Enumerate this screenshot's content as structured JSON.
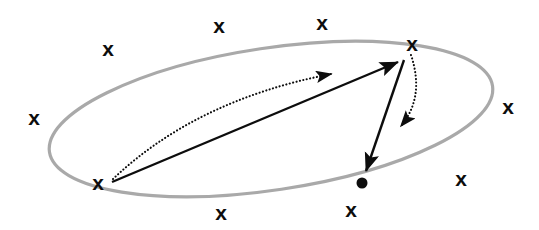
{
  "figure": {
    "name": "manifold-trajectory-diagram",
    "background_color": "#ffffff",
    "width": 539,
    "height": 230
  },
  "region": {
    "name": "ellipse-boundary",
    "shape": "ellipse",
    "label": "",
    "stroke_color": "#a9a9a9",
    "stroke_width": 3.2,
    "fill": "none",
    "center_x": 271,
    "center_y": 119,
    "radius_x": 224,
    "radius_y": 71,
    "rotation_deg": -8.5
  },
  "markers": {
    "glyph": "x",
    "color": "#0d0d0d",
    "font_size": 21,
    "items": [
      {
        "name": "x-marker-top-left-outer",
        "x": 108,
        "y": 48
      },
      {
        "name": "x-marker-top-mid-left",
        "x": 219,
        "y": 25
      },
      {
        "name": "x-marker-top-mid-right",
        "x": 322,
        "y": 22
      },
      {
        "name": "x-marker-top-right",
        "x": 412,
        "y": 43
      },
      {
        "name": "x-marker-right",
        "x": 508,
        "y": 106
      },
      {
        "name": "x-marker-bottom-right",
        "x": 461,
        "y": 178
      },
      {
        "name": "x-marker-bottom-mid-right",
        "x": 351,
        "y": 209
      },
      {
        "name": "x-marker-bottom-mid-left",
        "x": 221,
        "y": 212
      },
      {
        "name": "x-marker-left",
        "x": 34,
        "y": 117
      },
      {
        "name": "x-marker-source-point",
        "x": 98,
        "y": 182
      }
    ]
  },
  "point": {
    "name": "filled-dot-endpoint",
    "x": 362,
    "y": 183,
    "radius": 5.5,
    "color": "#0d0d0d"
  },
  "arrows": {
    "solid": [
      {
        "name": "solid-arrow-main-ascending",
        "style": "solid",
        "color": "#0d0d0d",
        "stroke_width": 2.4,
        "from_x": 112,
        "from_y": 182,
        "to_x": 398,
        "to_y": 62
      },
      {
        "name": "solid-arrow-descending-to-dot",
        "style": "solid",
        "color": "#0d0d0d",
        "stroke_width": 2.4,
        "from_x": 404,
        "from_y": 60,
        "to_x": 366,
        "to_y": 171
      }
    ],
    "dotted": [
      {
        "name": "dotted-arc-arrow-ascending",
        "style": "dotted",
        "color": "#0d0d0d",
        "stroke_width": 2.1,
        "from_x": 113,
        "from_y": 179,
        "ctrl_x": 196,
        "ctrl_y": 100,
        "to_x": 331,
        "to_y": 74
      },
      {
        "name": "dotted-arc-arrow-descending",
        "style": "dotted",
        "color": "#0d0d0d",
        "stroke_width": 2.1,
        "from_x": 411,
        "from_y": 55,
        "ctrl_x": 425,
        "ctrl_y": 97,
        "to_x": 401,
        "to_y": 126
      }
    ]
  }
}
